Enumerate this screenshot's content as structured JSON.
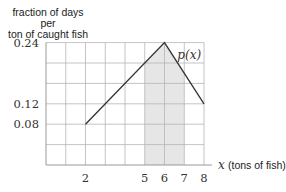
{
  "chart_data": {
    "type": "line",
    "title": "",
    "ylabel": "fraction of days per ton of caught fish",
    "ylabel_lines": [
      "fraction of days per",
      "ton of caught fish"
    ],
    "xlabel": "(tons of fish)",
    "xlabel_var": "x",
    "curve_label": "p(x)",
    "x": [
      2,
      6,
      8
    ],
    "y": [
      0.08,
      0.24,
      0.12
    ],
    "xlim": [
      0,
      8
    ],
    "ylim": [
      0,
      0.24
    ],
    "xticks": [
      2,
      5,
      6,
      7,
      8
    ],
    "xtick_labels": [
      "2",
      "5",
      "6",
      "7",
      "8"
    ],
    "yticks": [
      0.08,
      0.12,
      0.24
    ],
    "ytick_labels": [
      "0.08",
      "0.12",
      "0.24"
    ],
    "grid": true,
    "grid_x_step": 1,
    "grid_y_step": 0.04,
    "shaded_region": {
      "x_from": 5,
      "x_to": 7,
      "color": "#e6e6e6"
    },
    "line_color": "#333333",
    "grid_color": "#b5b5b5"
  }
}
